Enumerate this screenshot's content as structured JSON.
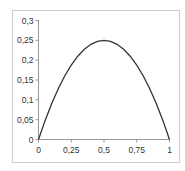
{
  "chart_data": {
    "type": "line",
    "title": "",
    "xlabel": "",
    "ylabel": "",
    "xlim": [
      0,
      1
    ],
    "ylim": [
      0,
      0.3
    ],
    "grid": false,
    "legend": null,
    "x_ticks": [
      "0",
      "0,25",
      "0,5",
      "0,75",
      "1"
    ],
    "y_ticks": [
      "0",
      "0,05",
      "0,1",
      "0,15",
      "0,2",
      "0,25",
      "0,3"
    ],
    "series": [
      {
        "name": "y = x(1 - x)",
        "x": [
          0,
          0.05,
          0.1,
          0.15,
          0.2,
          0.25,
          0.3,
          0.35,
          0.4,
          0.45,
          0.5,
          0.55,
          0.6,
          0.65,
          0.7,
          0.75,
          0.8,
          0.85,
          0.9,
          0.95,
          1
        ],
        "values": [
          0,
          0.0475,
          0.09,
          0.1275,
          0.16,
          0.1875,
          0.21,
          0.2275,
          0.24,
          0.2475,
          0.25,
          0.2475,
          0.24,
          0.2275,
          0.21,
          0.1875,
          0.16,
          0.1275,
          0.09,
          0.0475,
          0
        ],
        "color": "#333333"
      }
    ]
  },
  "colors": {
    "frame": "#cccccc",
    "axis": "#999999",
    "line": "#333333"
  }
}
